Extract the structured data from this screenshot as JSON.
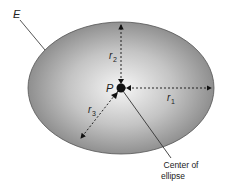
{
  "diagram": {
    "ellipse_label": "E",
    "point_label": "P",
    "radii": [
      {
        "name": "r",
        "sub": "1"
      },
      {
        "name": "r",
        "sub": "2"
      },
      {
        "name": "r",
        "sub": "3"
      }
    ],
    "callout": {
      "line1": "Center of",
      "line2": "ellipse"
    },
    "colors": {
      "fill_center": "#f4f4f4",
      "fill_edge": "#8a8a8a",
      "stroke": "#555555"
    }
  }
}
